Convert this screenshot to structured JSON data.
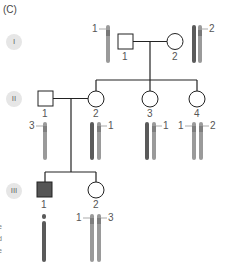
{
  "panel_label": "(C)",
  "generations": [
    {
      "roman": "I"
    },
    {
      "roman": "II"
    },
    {
      "roman": "III"
    }
  ],
  "individuals": {
    "I1": {
      "number": "1",
      "sex": "male",
      "affected": false,
      "alleles": [
        "1"
      ]
    },
    "I2": {
      "number": "2",
      "sex": "female",
      "affected": false,
      "alleles": [
        "2"
      ]
    },
    "II1": {
      "number": "1",
      "sex": "male",
      "affected": false,
      "alleles": [
        "3"
      ]
    },
    "II2": {
      "number": "2",
      "sex": "female",
      "affected": false,
      "alleles": [
        "1"
      ]
    },
    "II3": {
      "number": "3",
      "sex": "female",
      "affected": false,
      "alleles": [
        "1"
      ]
    },
    "II4": {
      "number": "4",
      "sex": "female",
      "affected": false,
      "alleles": [
        "1",
        "2"
      ]
    },
    "III1": {
      "number": "1",
      "sex": "male",
      "affected": true,
      "alleles": []
    },
    "III2": {
      "number": "2",
      "sex": "female",
      "affected": false,
      "alleles": [
        "1",
        "3"
      ]
    }
  },
  "colors": {
    "line": "#222222",
    "affected_fill": "#555555",
    "chrom_light": "#9a9a9a",
    "chrom_dark": "#5a5a5a",
    "gen_badge": "#e6e6e6"
  },
  "edge_text": [
    "e",
    "d",
    "e"
  ]
}
